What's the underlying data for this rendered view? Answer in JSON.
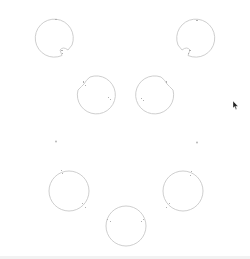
{
  "canvas": {
    "width": 250,
    "height": 259,
    "background": "#ffffff",
    "stroke_color": "#c8c8c8",
    "mark_color": "#b0b0b0"
  },
  "shapes": [
    {
      "name": "circle-top-left",
      "type": "notched-circle",
      "cx": 55,
      "cy": 38,
      "r": 19,
      "notch": "bottom-right"
    },
    {
      "name": "circle-top-right",
      "type": "notched-circle",
      "cx": 195,
      "cy": 38,
      "r": 19,
      "notch": "bottom-left"
    },
    {
      "name": "circle-mid-left",
      "type": "notched-circle",
      "cx": 96,
      "cy": 95,
      "r": 19,
      "notch": "top-left"
    },
    {
      "name": "circle-mid-right",
      "type": "notched-circle",
      "cx": 155,
      "cy": 95,
      "r": 19,
      "notch": "top-right"
    },
    {
      "name": "circle-bottom-left",
      "type": "circle",
      "cx": 69,
      "cy": 191,
      "r": 20
    },
    {
      "name": "circle-bottom-right",
      "type": "circle",
      "cx": 183,
      "cy": 191,
      "r": 20
    },
    {
      "name": "circle-bottom-center",
      "type": "circle",
      "cx": 126,
      "cy": 226,
      "r": 20
    }
  ],
  "points": [
    {
      "name": "dot-left",
      "x": 56,
      "y": 141
    },
    {
      "name": "dot-right",
      "x": 197,
      "y": 142
    }
  ],
  "cursor": {
    "x": 233,
    "y": 101,
    "icon": "arrow-pointer"
  }
}
